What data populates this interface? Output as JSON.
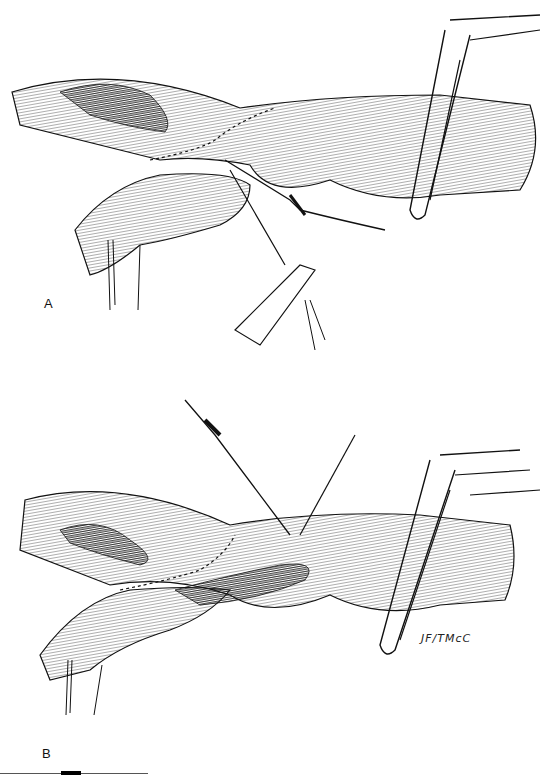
{
  "figure": {
    "panels": [
      {
        "label": "A",
        "description": "Vessel anastomosis with continuous suture line, needle holder, cannula inserted, and vascular clamp on right"
      },
      {
        "label": "B",
        "description": "Completed anastomosis with cannula/needle inserted from above and vascular clamp on right"
      }
    ],
    "signature": "JF/TMcC",
    "colors": {
      "ink": "#111111",
      "shadow": "#2a2a2a",
      "background": "#ffffff"
    }
  }
}
